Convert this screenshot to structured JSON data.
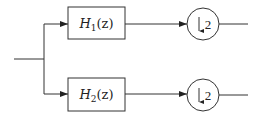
{
  "diagram": {
    "type": "two-channel analysis filter bank",
    "input": {
      "label": ""
    },
    "branches": [
      {
        "filter": {
          "name": "H",
          "subscript": "1",
          "arg": "(z)"
        },
        "downsampler": {
          "symbol": "↓",
          "factor": "2"
        }
      },
      {
        "filter": {
          "name": "H",
          "subscript": "2",
          "arg": "(z)"
        },
        "downsampler": {
          "symbol": "↓",
          "factor": "2"
        }
      }
    ],
    "colors": {
      "stroke": "#333333",
      "background": "#ffffff"
    }
  }
}
